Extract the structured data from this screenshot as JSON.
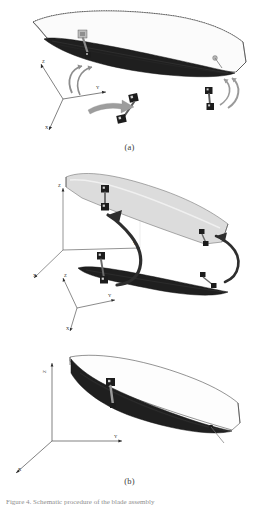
{
  "figure": {
    "background_color": "#ffffff",
    "ink_color": "#1a1a1a",
    "wing_fill_dark": "#262626",
    "wing_fill_light": "#d9d9d9",
    "arrow_fill": "#9a9a9a",
    "sensor_color": "#1c1c1c"
  },
  "panels": [
    {
      "id": "a",
      "label": "(a)",
      "description": "Undeformed blade with dotted reference outline, global coordinate frame and two accelerometer dumbbell sensors with curved rotation arrows",
      "axes": {
        "x": "X",
        "y": "Y",
        "z": "Z"
      },
      "sensors": [
        {
          "name": "sensor-root-top",
          "label": ""
        },
        {
          "name": "sensor-mid-detached",
          "label": ""
        },
        {
          "name": "sensor-tip-detached",
          "label": ""
        },
        {
          "name": "sensor-tip-marker",
          "label": ""
        }
      ],
      "arrows": [
        {
          "name": "rotation-arrow-root",
          "label": ""
        },
        {
          "name": "translation-arrow-mid",
          "label": ""
        },
        {
          "name": "rotation-arrow-tip",
          "label": ""
        }
      ]
    },
    {
      "id": "b",
      "label": "(b)",
      "description": "Blade shown lifted and rotated (light grey) above its original dark position, with two curved motion arrows, a box reference frame and a secondary coordinate triad",
      "axes": {
        "x": "X",
        "y": "Y",
        "z": "Z"
      },
      "axes2": {
        "x": "X",
        "y": "Y",
        "z": "Z"
      },
      "sensors": [
        {
          "name": "sensor-upper-pair",
          "label": ""
        },
        {
          "name": "sensor-lower-pair",
          "label": ""
        },
        {
          "name": "sensor-upper-tip",
          "label": ""
        },
        {
          "name": "sensor-lower-tip",
          "label": ""
        }
      ],
      "arrows": [
        {
          "name": "motion-arrow-root",
          "label": ""
        },
        {
          "name": "motion-arrow-tip",
          "label": ""
        }
      ]
    },
    {
      "id": "c",
      "label": "(c)",
      "description": "Final assembled blade with thin reference outline, single mounted sensor and global coordinate frame",
      "axes": {
        "x": "X",
        "y": "Y",
        "z": "Z"
      },
      "sensors": [
        {
          "name": "sensor-mid",
          "label": ""
        },
        {
          "name": "sensor-tip-marker",
          "label": ""
        }
      ]
    }
  ],
  "caption": {
    "text": "Figure 4. Schematic procedure of the blade assembly",
    "visible": "cropped"
  }
}
